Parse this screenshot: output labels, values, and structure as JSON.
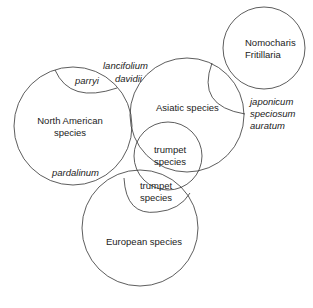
{
  "diagram": {
    "type": "venn",
    "circles": [
      {
        "id": "north-american",
        "label": "North American species"
      },
      {
        "id": "asiatic",
        "label": "Asiatic species"
      },
      {
        "id": "nomocharis",
        "label": "Nomocharis Fritillaria"
      },
      {
        "id": "trumpet-upper",
        "label": "trumpet species"
      },
      {
        "id": "european",
        "label": "European species"
      }
    ],
    "labels": {
      "north_american_1": "North American",
      "north_american_2": "species",
      "parryi": "parryi",
      "lancifolium": "lancifolium",
      "davidii": "davidii",
      "asiatic": "Asiatic species",
      "nomocharis": "Nomocharis",
      "fritillaria": "Fritillaria",
      "japonicum": "japonicum",
      "speciosum": "speciosum",
      "auratum": "auratum",
      "pardalinum": "pardalinum",
      "trumpet_upper_1": "trumpet",
      "trumpet_upper_2": "species",
      "trumpet_lower_1": "trumpet",
      "trumpet_lower_2": "species",
      "european": "European species"
    },
    "line_color": "#333333"
  }
}
